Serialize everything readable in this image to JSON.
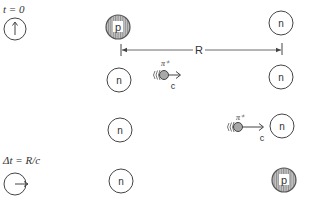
{
  "diagram": {
    "type": "pion-exchange",
    "clock_top": {
      "label": "t = 0",
      "hand": "up"
    },
    "clock_bottom": {
      "label": "Δt = R/c",
      "hand": "right"
    },
    "distance_label": "R",
    "left_column": [
      {
        "label": "p",
        "kind": "proton"
      },
      {
        "label": "n",
        "kind": "neutron"
      },
      {
        "label": "n",
        "kind": "neutron"
      },
      {
        "label": "n",
        "kind": "neutron"
      }
    ],
    "right_column": [
      {
        "label": "n",
        "kind": "neutron"
      },
      {
        "label": "n",
        "kind": "neutron"
      },
      {
        "label": "n",
        "kind": "neutron"
      },
      {
        "label": "p",
        "kind": "proton"
      }
    ],
    "pion_1": {
      "label": "π⁺",
      "speed_label": "c"
    },
    "pion_2": {
      "label": "π⁺",
      "speed_label": "c"
    },
    "colors": {
      "stroke": "#444444",
      "proton_fill": "#b9b9b9",
      "pion_fill": "#a8a8a8",
      "background": "#ffffff"
    }
  }
}
